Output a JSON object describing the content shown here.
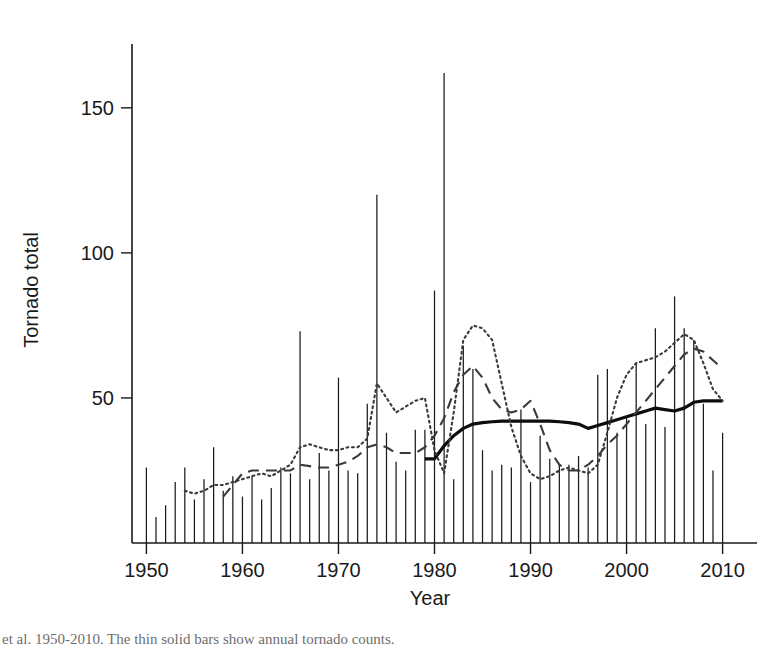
{
  "figure": {
    "background_color": "#ffffff",
    "caption": "et al. 1950-2010. The thin solid bars show annual tornado counts."
  },
  "chart_data": {
    "type": "bar",
    "title": "",
    "xlabel": "Year",
    "ylabel": "Tornado total",
    "xlim": [
      1948.5,
      2011.5
    ],
    "ylim": [
      0,
      172
    ],
    "grid": false,
    "legend": "none",
    "x_ticks": [
      1950,
      1960,
      1970,
      1980,
      1990,
      2000,
      2010
    ],
    "x_tick_labels": [
      "1950",
      "1960",
      "1970",
      "1980",
      "1990",
      "2000",
      "2010"
    ],
    "y_ticks": [
      50,
      100,
      150
    ],
    "y_tick_labels": [
      "50",
      "100",
      "150"
    ],
    "categories": [
      1950,
      1951,
      1952,
      1953,
      1954,
      1955,
      1956,
      1957,
      1958,
      1959,
      1960,
      1961,
      1962,
      1963,
      1964,
      1965,
      1966,
      1967,
      1968,
      1969,
      1970,
      1971,
      1972,
      1973,
      1974,
      1975,
      1976,
      1977,
      1978,
      1979,
      1980,
      1981,
      1982,
      1983,
      1984,
      1985,
      1986,
      1987,
      1988,
      1989,
      1990,
      1991,
      1992,
      1993,
      1994,
      1995,
      1996,
      1997,
      1998,
      1999,
      2000,
      2001,
      2002,
      2003,
      2004,
      2005,
      2006,
      2007,
      2008,
      2009,
      2010
    ],
    "values": [
      26,
      9,
      13,
      21,
      26,
      15,
      22,
      33,
      18,
      23,
      16,
      23,
      15,
      19,
      26,
      24,
      73,
      22,
      31,
      25,
      57,
      25,
      24,
      48,
      120,
      38,
      28,
      25,
      39,
      39,
      87,
      162,
      22,
      68,
      60,
      32,
      25,
      27,
      26,
      46,
      21,
      37,
      29,
      27,
      27,
      30,
      26,
      58,
      60,
      38,
      43,
      62,
      41,
      74,
      40,
      85,
      74,
      70,
      48,
      25,
      38
    ],
    "series": [
      {
        "name": "solid-trend",
        "style": "solid",
        "x": [
          1979,
          1980,
          1981,
          1982,
          1983,
          1984,
          1985,
          1986,
          1987,
          1988,
          1989,
          1990,
          1991,
          1992,
          1993,
          1994,
          1995,
          1996,
          1997,
          1998,
          1999,
          2000,
          2001,
          2002,
          2003,
          2004,
          2005,
          2006,
          2007,
          2008,
          2009,
          2010
        ],
        "values": [
          29,
          29,
          33.5,
          37,
          39.5,
          41,
          41.5,
          41.8,
          42,
          42,
          42,
          42,
          42,
          42,
          41.8,
          41.5,
          41,
          39.5,
          40.5,
          41.5,
          42.5,
          43.5,
          44.5,
          45.5,
          46.5,
          46,
          45.5,
          46.5,
          48.5,
          49,
          49,
          49
        ]
      },
      {
        "name": "dashed-trend",
        "style": "dashed",
        "x": [
          1958,
          1959,
          1960,
          1961,
          1962,
          1963,
          1964,
          1965,
          1966,
          1967,
          1968,
          1969,
          1970,
          1971,
          1972,
          1973,
          1974,
          1975,
          1976,
          1977,
          1978,
          1979,
          1980,
          1981,
          1982,
          1983,
          1984,
          1985,
          1986,
          1987,
          1988,
          1989,
          1990,
          1991,
          1992,
          1993,
          1994,
          1995,
          1996,
          1997,
          1998,
          1999,
          2000,
          2001,
          2002,
          2003,
          2004,
          2005,
          2006,
          2007,
          2008,
          2009,
          2010
        ],
        "values": [
          16,
          20,
          24,
          25,
          25,
          25,
          25,
          25,
          27,
          26.5,
          26,
          26,
          27,
          28,
          30,
          33,
          34,
          33,
          31,
          31,
          31,
          33,
          37,
          43,
          52,
          58,
          61,
          57,
          50,
          46,
          45,
          46,
          49,
          41,
          32,
          27,
          25,
          25,
          27,
          30,
          34,
          37,
          41,
          45,
          49,
          53,
          57,
          61,
          65,
          67,
          66,
          63,
          60
        ]
      },
      {
        "name": "dotted-trend",
        "style": "dotted",
        "x": [
          1954,
          1955,
          1956,
          1957,
          1958,
          1959,
          1960,
          1961,
          1962,
          1963,
          1964,
          1965,
          1966,
          1967,
          1968,
          1969,
          1970,
          1971,
          1972,
          1973,
          1974,
          1975,
          1976,
          1977,
          1978,
          1979,
          1980,
          1981,
          1982,
          1983,
          1984,
          1985,
          1986,
          1987,
          1988,
          1989,
          1990,
          1991,
          1992,
          1993,
          1994,
          1995,
          1996,
          1997,
          1998,
          1999,
          2000,
          2001,
          2002,
          2003,
          2004,
          2005,
          2006,
          2007,
          2008,
          2009,
          2010
        ],
        "values": [
          18,
          17,
          18,
          20,
          20,
          21,
          22,
          23,
          24,
          23,
          25,
          27,
          33,
          34,
          33,
          32,
          32,
          33,
          33,
          36,
          55,
          50,
          45,
          47,
          49,
          50,
          32,
          24,
          45,
          70,
          75,
          74,
          70,
          55,
          40,
          30,
          24,
          22,
          23,
          25,
          26,
          25,
          24,
          27,
          38,
          50,
          58,
          62,
          63,
          64,
          66,
          69,
          72,
          70,
          62,
          53,
          49
        ]
      }
    ]
  }
}
